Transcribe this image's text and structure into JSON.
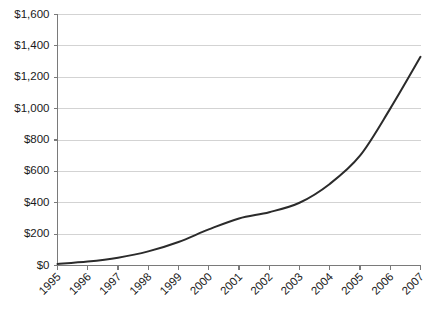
{
  "chart_data": {
    "type": "line",
    "title": "",
    "subtitle": "",
    "xlabel": "",
    "ylabel": "",
    "categories": [
      "1995",
      "1996",
      "1997",
      "1998",
      "1999",
      "2000",
      "2001",
      "2002",
      "2003",
      "2004",
      "2005",
      "2006",
      "2007"
    ],
    "series": [
      {
        "name": "",
        "values": [
          10,
          25,
          50,
          90,
          150,
          230,
          300,
          340,
          400,
          520,
          700,
          1000,
          1330
        ]
      }
    ],
    "ylim": [
      0,
      1600
    ],
    "ytick_values": [
      0,
      200,
      400,
      600,
      800,
      1000,
      1200,
      1400,
      1600
    ],
    "ytick_labels": [
      "$0",
      "$200",
      "$400",
      "$600",
      "$800",
      "$1,000",
      "$1,200",
      "$1,400",
      "$1,600"
    ],
    "xtick_labels": [
      "1995",
      "1996",
      "1997",
      "1998",
      "1999",
      "2000",
      "2001",
      "2002",
      "2003",
      "2004",
      "2005",
      "2006",
      "2007"
    ],
    "xtick_label_rotation": -45,
    "grid": true,
    "grid_axis": "y",
    "legend": false,
    "legend_position": "none",
    "line_color": "#2b2b2b",
    "grid_color": "#c8c8c8",
    "axis_color": "#7a7a7a",
    "background_color": "#ffffff",
    "annotations": []
  }
}
